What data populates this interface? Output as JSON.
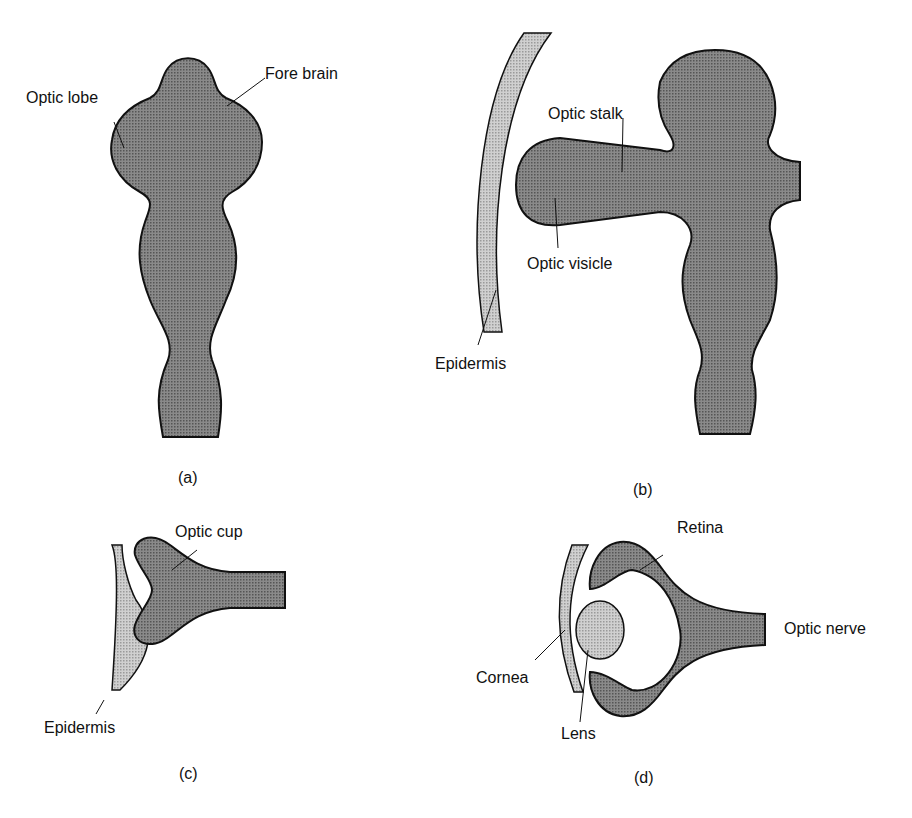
{
  "figure": {
    "panels": [
      {
        "id": "a",
        "caption": "(a)",
        "labels": [
          "Optic lobe",
          "Fore brain"
        ]
      },
      {
        "id": "b",
        "caption": "(b)",
        "labels": [
          "Optic stalk",
          "Optic visicle",
          "Epidermis"
        ]
      },
      {
        "id": "c",
        "caption": "(c)",
        "labels": [
          "Optic cup",
          "Epidermis"
        ]
      },
      {
        "id": "d",
        "caption": "(d)",
        "labels": [
          "Retina",
          "Optic nerve",
          "Cornea",
          "Lens"
        ]
      }
    ]
  },
  "colors": {
    "tissue_dark": "#7a7a7a",
    "tissue_light": "#bdbdbd",
    "outline": "#111111",
    "background": "#ffffff"
  }
}
